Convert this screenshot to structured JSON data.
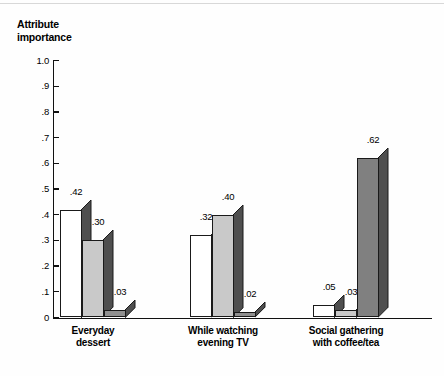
{
  "chart_data": {
    "type": "bar",
    "title": "Attribute importance",
    "ylabel": "Attribute importance",
    "xlabel": "",
    "ylim": [
      0,
      1.0
    ],
    "ytick_labels": [
      "1.0",
      ".9",
      ".8",
      ".7",
      ".6",
      ".5",
      ".4",
      ".3",
      ".2",
      ".1",
      "0"
    ],
    "ytick_values": [
      1.0,
      0.9,
      0.8,
      0.7,
      0.6,
      0.5,
      0.4,
      0.3,
      0.2,
      0.1,
      0.0
    ],
    "grid": false,
    "legend": "none",
    "categories": [
      "Everyday\ndessert",
      "While watching\nevening TV",
      "Social gathering\nwith coffee/tea"
    ],
    "series": [
      {
        "name": "Series 1",
        "fill": "#ffffff",
        "values": [
          0.42,
          0.32,
          0.05
        ],
        "labels": [
          ".42",
          ".32",
          ".05"
        ]
      },
      {
        "name": "Series 2",
        "fill": "#c9c9c9",
        "values": [
          0.3,
          0.4,
          0.03
        ],
        "labels": [
          ".30",
          ".40",
          ".03"
        ]
      },
      {
        "name": "Series 3",
        "fill": "#808080",
        "values": [
          0.03,
          0.02,
          0.62
        ],
        "labels": [
          ".03",
          ".02",
          ".62"
        ]
      }
    ],
    "bar_side_color": "#4f4f4f",
    "axis_color": "#111111"
  },
  "chart": {
    "title_text": "Attribute\nimportance",
    "groups": [
      {
        "label": "Everyday\ndessert",
        "bars": [
          {
            "value": 0.42,
            "label": ".42",
            "fill": "#ffffff"
          },
          {
            "value": 0.3,
            "label": ".30",
            "fill": "#c9c9c9"
          },
          {
            "value": 0.03,
            "label": ".03",
            "fill": "#909090"
          }
        ]
      },
      {
        "label": "While watching\nevening TV",
        "bars": [
          {
            "value": 0.32,
            "label": ".32",
            "fill": "#ffffff"
          },
          {
            "value": 0.4,
            "label": ".40",
            "fill": "#c9c9c9"
          },
          {
            "value": 0.02,
            "label": ".02",
            "fill": "#909090"
          }
        ]
      },
      {
        "label": "Social gathering\nwith coffee/tea",
        "bars": [
          {
            "value": 0.05,
            "label": ".05",
            "fill": "#ffffff"
          },
          {
            "value": 0.03,
            "label": ".03",
            "fill": "#c9c9c9"
          },
          {
            "value": 0.62,
            "label": ".62",
            "fill": "#808080"
          }
        ]
      }
    ],
    "y_ticks": [
      "1.0",
      ".9",
      ".8",
      ".7",
      ".6",
      ".5",
      ".4",
      ".3",
      ".2",
      ".1",
      "0"
    ]
  }
}
